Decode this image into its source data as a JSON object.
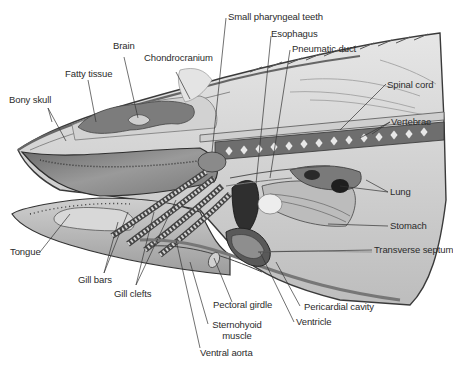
{
  "diagram": {
    "labels": {
      "small_pharyngeal_teeth": "Small pharyngeal teeth",
      "esophagus": "Esophagus",
      "pneumatic_duct": "Pneumatic duct",
      "brain": "Brain",
      "chondrocranium": "Chondrocranium",
      "fatty_tissue": "Fatty tissue",
      "bony_skull": "Bony skull",
      "spinal_cord": "Spinal cord",
      "vertebrae": "Vertebrae",
      "lung": "Lung",
      "stomach": "Stomach",
      "transverse_septum": "Transverse septum",
      "tongue": "Tongue",
      "gill_bars": "Gill bars",
      "gill_clefts": "Gill clefts",
      "pectoral_girdle": "Pectoral girdle",
      "sternohyoid_muscle_line1": "Sternohyoid",
      "sternohyoid_muscle_line2": "muscle",
      "pericardial_cavity": "Pericardial cavity",
      "ventricle": "Ventricle",
      "ventral_aorta": "Ventral aorta"
    },
    "colors": {
      "ink": "#2b2b2b",
      "tissue_light": "#d9d9d9",
      "tissue_mid": "#a8a8a8",
      "tissue_dark": "#555555",
      "background": "#ffffff"
    }
  }
}
